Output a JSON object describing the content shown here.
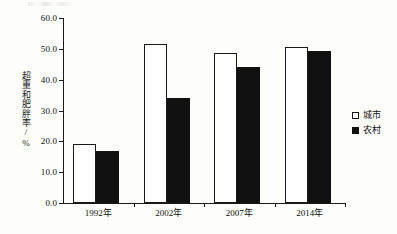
{
  "chart_data": {
    "type": "bar",
    "title": "",
    "subtitle": "",
    "xlabel": "",
    "ylabel": "超重和肥胖率/%",
    "ylim": [
      0.0,
      60.0
    ],
    "ytick_step": 10.0,
    "ytick_labels": [
      "0.0",
      "10.0",
      "20.0",
      "30.0",
      "40.0",
      "50.0",
      "60.0"
    ],
    "ytick_values": [
      0.0,
      10.0,
      20.0,
      30.0,
      40.0,
      50.0,
      60.0
    ],
    "grid": false,
    "legend_position": "right",
    "categories": [
      "1992年",
      "2002年",
      "2007年",
      "2014年"
    ],
    "series": [
      {
        "name": "城市",
        "fill": "#ffffff",
        "edge": "#1a1a1a",
        "values": [
          19.1,
          51.6,
          48.7,
          50.6
        ]
      },
      {
        "name": "农村",
        "fill": "#111111",
        "edge": "#111111",
        "values": [
          16.9,
          34.1,
          44.2,
          49.4
        ]
      }
    ]
  },
  "legend": {
    "items": [
      {
        "label": "城市",
        "swatch": "hollow-square-icon"
      },
      {
        "label": "农村",
        "swatch": "filled-square-icon"
      }
    ]
  },
  "colors": {
    "axis": "#1a1a1a",
    "text": "#111111",
    "urban_bar": "#ffffff",
    "rural_bar": "#111111",
    "background": "#fdfdfc"
  }
}
